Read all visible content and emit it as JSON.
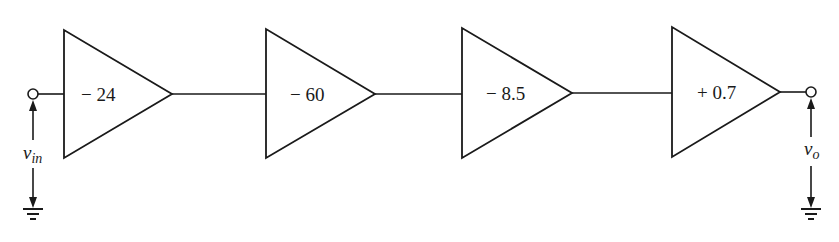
{
  "diagram": {
    "type": "cascaded-amplifier-block-diagram",
    "line_color": "#1a1a1a",
    "background": "#ffffff",
    "input": {
      "label": "v",
      "subscript": "in",
      "terminal": "open-circle",
      "reference": "ground"
    },
    "output": {
      "label": "v",
      "subscript": "o",
      "terminal": "open-circle",
      "reference": "ground"
    },
    "stages": [
      {
        "gain": "− 24"
      },
      {
        "gain": "− 60"
      },
      {
        "gain": "− 8.5"
      },
      {
        "gain": "+ 0.7"
      }
    ]
  }
}
